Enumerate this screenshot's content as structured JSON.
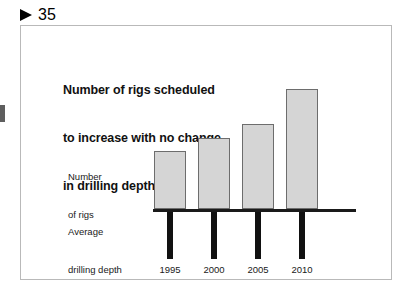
{
  "header": {
    "marker_icon": "triangle-right-icon",
    "page_number": "35"
  },
  "figure": {
    "title_line1": "Number of rigs scheduled",
    "title_line2": "to increase with no change",
    "title_line3": "in drilling depth",
    "label_rigs_line1": "Number",
    "label_rigs_line2": "of rigs",
    "label_depth_line1": "Average",
    "label_depth_line2": "drilling depth"
  },
  "colors": {
    "bar_fill": "#d5d5d5",
    "bar_stroke": "#6d6d6d",
    "axis": "#1a1a1a",
    "depth_bar": "#111111",
    "frame": "#b9b9b9"
  },
  "chart_data": {
    "type": "bar",
    "title": "Number of rigs scheduled to increase with no change in drilling depth",
    "xlabel": "",
    "ylabel": "Number of rigs",
    "categories": [
      "1995",
      "2000",
      "2005",
      "2010"
    ],
    "grid": false,
    "legend": "none",
    "series": [
      {
        "name": "Number of rigs",
        "direction": "up",
        "values": [
          58,
          71,
          85,
          120
        ],
        "ylim": [
          0,
          130
        ],
        "bar_heights_px": [
          58,
          71,
          85,
          120
        ]
      },
      {
        "name": "Average drilling depth",
        "direction": "down",
        "values": [
          47,
          47,
          47,
          47
        ],
        "bar_heights_px": [
          47,
          47,
          47,
          47
        ]
      }
    ],
    "annotation": "Rig count rises steadily from 1995 to 2010 while average drilling depth stays flat."
  }
}
